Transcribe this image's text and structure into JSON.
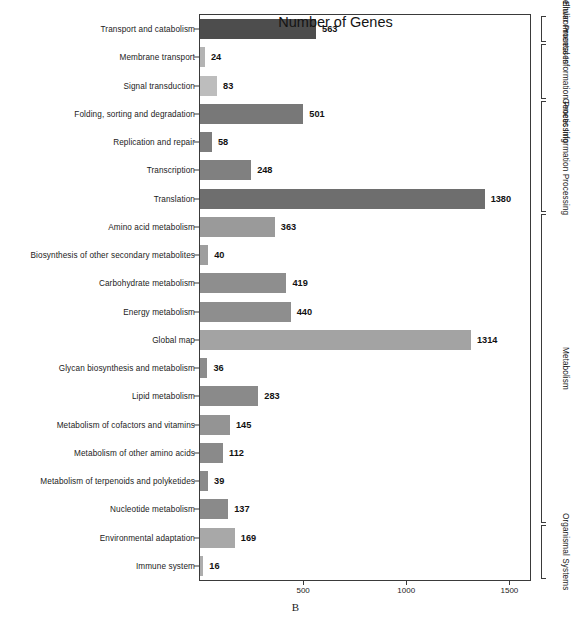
{
  "chart_data": {
    "type": "bar",
    "orientation": "horizontal",
    "title": "",
    "xlabel": "Number of Genes",
    "ylabel": "",
    "panel_label": "B",
    "xlim": [
      0,
      1600
    ],
    "xticks": [
      500,
      1000,
      1500
    ],
    "xticklabels": [
      "500",
      "1000",
      "1500"
    ],
    "grid": false,
    "legend": null,
    "categories": [
      "Transport and catabolism",
      "Membrane transport",
      "Signal transduction",
      "Folding, sorting and degradation",
      "Replication and repair",
      "Transcription",
      "Translation",
      "Amino acid metabolism",
      "Biosynthesis of other secondary metabolites",
      "Carbohydrate metabolism",
      "Energy metabolism",
      "Global map",
      "Glycan biosynthesis and metabolism",
      "Lipid metabolism",
      "Metabolism of cofactors and vitamins",
      "Metabolism of other amino acids",
      "Metabolism of terpenoids and polyketides",
      "Nucleotide metabolism",
      "Environmental adaptation",
      "Immune system"
    ],
    "values": [
      563,
      24,
      83,
      501,
      58,
      248,
      1380,
      363,
      40,
      419,
      440,
      1314,
      36,
      283,
      145,
      112,
      39,
      137,
      169,
      16
    ],
    "value_labels": [
      "563",
      "24",
      "83",
      "501",
      "58",
      "248",
      "1380",
      "363",
      "40",
      "419",
      "440",
      "1314",
      "36",
      "283",
      "145",
      "112",
      "39",
      "137",
      "169",
      "16"
    ],
    "bar_colors": [
      "#4d4d4d",
      "#b4b4b4",
      "#bdbdbd",
      "#787878",
      "#7d7d7d",
      "#808080",
      "#6e6e6e",
      "#9a9a9a",
      "#9e9e9e",
      "#8e8e8e",
      "#8e8e8e",
      "#a3a3a3",
      "#8c8c8c",
      "#8a8a8a",
      "#949494",
      "#8a8a8a",
      "#8a8a8a",
      "#8a8a8a",
      "#a8a8a8",
      "#adadad"
    ],
    "groups": [
      {
        "label": "Cellular Processes",
        "start_index": 0,
        "end_index": 0
      },
      {
        "label": "Environmental Information Processing",
        "start_index": 1,
        "end_index": 2
      },
      {
        "label": "Genetic Information Processing",
        "start_index": 3,
        "end_index": 6
      },
      {
        "label": "Metabolism",
        "start_index": 7,
        "end_index": 17
      },
      {
        "label": "Organismal Systems",
        "start_index": 18,
        "end_index": 19
      }
    ]
  }
}
